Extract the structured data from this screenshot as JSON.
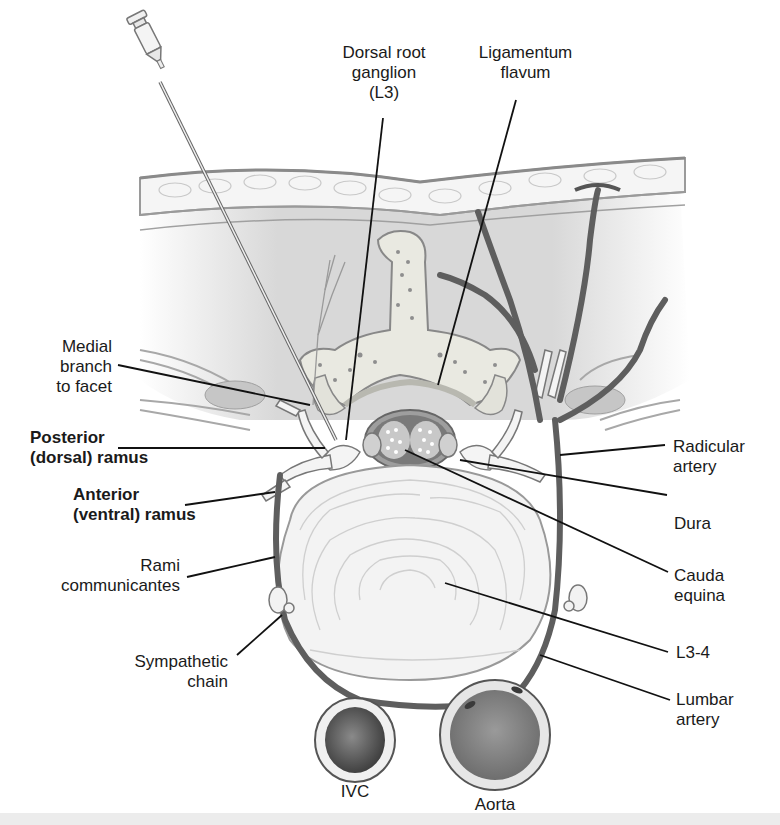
{
  "figure": {
    "colors": {
      "background": "#ffffff",
      "soft_tissue": "#d4d4d4",
      "muscle_dark": "#bdbdbd",
      "bone": "#e8e8e0",
      "bone_spots": "#8a8a8a",
      "vessel": "#5e5e5e",
      "disc": "#f2f2f2",
      "leader_line": "#111111",
      "bottom_strip": "#ececec"
    }
  },
  "labels": {
    "dorsal_root_ganglion": "Dorsal root\nganglion\n(L3)",
    "ligamentum_flavum": "Ligamentum\nflavum",
    "medial_branch": "Medial\nbranch\nto facet",
    "posterior_ramus": "Posterior\n(dorsal) ramus",
    "anterior_ramus": "Anterior\n(ventral) ramus",
    "rami_communicantes": "Rami\ncommunicantes",
    "sympathetic_chain": "Sympathetic\nchain",
    "radicular_artery": "Radicular\nartery",
    "dura": "Dura",
    "cauda_equina": "Cauda\nequina",
    "l3_4": "L3-4",
    "lumbar_artery": "Lumbar\nartery",
    "ivc": "IVC",
    "aorta": "Aorta"
  }
}
